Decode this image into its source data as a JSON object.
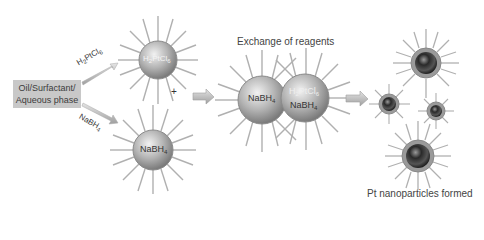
{
  "diagram": {
    "start_box": {
      "line1": "Oil/Surfactant/",
      "line2": "Aqueous phase"
    },
    "arrow_labels": {
      "upper": {
        "main": "H",
        "sub1": "2",
        "mid": "PtCl",
        "sub2": "6"
      },
      "lower": {
        "main": "NaBH",
        "sub": "4"
      }
    },
    "micelles": {
      "top": {
        "main": "H",
        "sub1": "2",
        "mid": "PtCl",
        "sub2": "6"
      },
      "bottom": {
        "main": "NaBH",
        "sub": "4"
      },
      "exchange_left": {
        "main": "NaBH",
        "sub": "4"
      },
      "exchange_right_top": {
        "main": "H",
        "sub1": "2",
        "mid": "PtCl",
        "sub2": "6"
      },
      "exchange_right_bottom": {
        "main": "NaBH",
        "sub": "4"
      }
    },
    "plus_sign": "+",
    "exchange_title": "Exchange of reagents",
    "result_caption": "Pt nanoparticles formed",
    "colors": {
      "spike": "#a8a8a8",
      "micelle_shell": "#9a9a9a",
      "core_dark": "#222222",
      "arrow": "#bdbdbd",
      "box": "#c8c8c8"
    }
  }
}
